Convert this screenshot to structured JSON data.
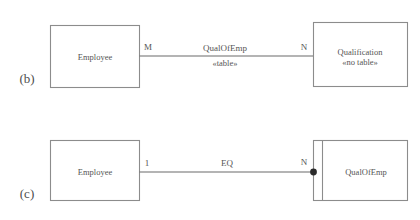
{
  "figure": {
    "background_color": "#ffffff",
    "line_color": "#8c8c8c",
    "text_color": "#555555"
  },
  "parts": [
    {
      "id": "b",
      "caption": "(b)",
      "left_class": {
        "name": "Employee",
        "stereotype": ""
      },
      "right_class": {
        "name": "Qualification",
        "stereotype": "«no table»"
      },
      "association": {
        "name": "QualOfEmp",
        "stereotype": "«table»",
        "left_multiplicity": "M",
        "right_multiplicity": "N",
        "end_marker": "none"
      }
    },
    {
      "id": "c",
      "caption": "(c)",
      "left_class": {
        "name": "Employee",
        "stereotype": ""
      },
      "right_class": {
        "name": "QualOfEmp",
        "stereotype": "",
        "has_left_compartment": true
      },
      "association": {
        "name": "EQ",
        "stereotype": "",
        "left_multiplicity": "1",
        "right_multiplicity": "N",
        "end_marker": "filled-dot"
      }
    }
  ]
}
